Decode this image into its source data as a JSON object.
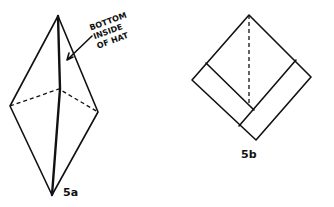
{
  "figures": [
    {
      "id": "5a",
      "label": "5a",
      "annotation": [
        "BOTTOM",
        "INSIDE",
        "OF HAT"
      ]
    },
    {
      "id": "5b",
      "label": "5b"
    }
  ]
}
